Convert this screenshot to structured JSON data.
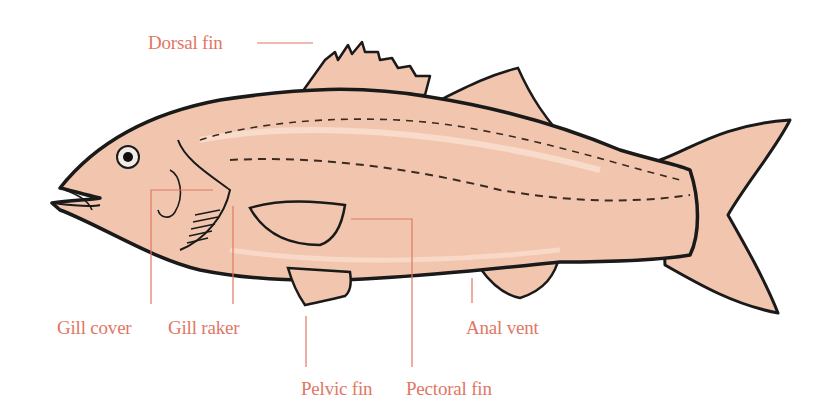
{
  "diagram": {
    "label_color": "#e07765",
    "body_color": "#f2c6ae",
    "outline_color": "#1a1a1a",
    "labels": {
      "dorsal_fin": "Dorsal fin",
      "gill_cover": "Gill cover",
      "gill_raker": "Gill raker",
      "anal_vent": "Anal vent",
      "pelvic_fin": "Pelvic fin",
      "pectoral_fin": "Pectoral fin"
    }
  }
}
